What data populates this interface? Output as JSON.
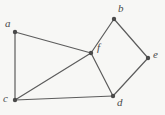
{
  "figure": {
    "background_color": "#f7f7f5",
    "edge_color": "#5c5c5c",
    "vertex_color": "#4a4a4a",
    "label_color": "#4a4a4a",
    "width": 165,
    "height": 115
  },
  "chart_data": {
    "type": "diagram",
    "subtype": "undirected-graph",
    "title": "",
    "xlabel": "",
    "ylabel": "",
    "grid": false,
    "legend": null,
    "vertex_count": 6,
    "edge_count": 8,
    "vertices": [
      {
        "id": "a",
        "label": "a",
        "x": 15,
        "y": 32,
        "label_x": 5,
        "label_y": 18,
        "degree": 2
      },
      {
        "id": "b",
        "label": "b",
        "x": 114,
        "y": 19,
        "label_x": 118,
        "label_y": 3,
        "degree": 2
      },
      {
        "id": "c",
        "label": "c",
        "x": 15,
        "y": 100,
        "label_x": 3,
        "label_y": 93,
        "degree": 3
      },
      {
        "id": "d",
        "label": "d",
        "x": 113,
        "y": 96,
        "label_x": 117,
        "label_y": 97,
        "degree": 3
      },
      {
        "id": "e",
        "label": "e",
        "x": 148,
        "y": 58,
        "label_x": 153,
        "label_y": 49,
        "degree": 2
      },
      {
        "id": "f",
        "label": "f",
        "x": 91,
        "y": 53,
        "label_x": 97,
        "label_y": 42,
        "degree": 4
      }
    ],
    "edges": [
      {
        "from": "a",
        "to": "c"
      },
      {
        "from": "a",
        "to": "f"
      },
      {
        "from": "c",
        "to": "f"
      },
      {
        "from": "c",
        "to": "d"
      },
      {
        "from": "f",
        "to": "b"
      },
      {
        "from": "f",
        "to": "d"
      },
      {
        "from": "b",
        "to": "e"
      },
      {
        "from": "d",
        "to": "e"
      }
    ]
  }
}
